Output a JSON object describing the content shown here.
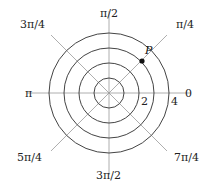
{
  "diagram": {
    "type": "polar-grid",
    "center": {
      "x": 109,
      "y": 93
    },
    "unit_px": 15,
    "circles": [
      1,
      2,
      3,
      4
    ],
    "ray_length_px": 82,
    "colors": {
      "circle": "#444444",
      "ray": "#999999",
      "point": "#111111"
    },
    "angle_labels": [
      {
        "text": "0",
        "x": 185,
        "y": 97
      },
      {
        "text": "π/4",
        "x": 176,
        "y": 28
      },
      {
        "text": "π/2",
        "x": 100,
        "y": 17
      },
      {
        "text": "3π/4",
        "x": 20,
        "y": 28
      },
      {
        "text": "π",
        "x": 25,
        "y": 97
      },
      {
        "text": "5π/4",
        "x": 17,
        "y": 161
      },
      {
        "text": "3π/2",
        "x": 96,
        "y": 179
      },
      {
        "text": "7π/4",
        "x": 174,
        "y": 161
      }
    ],
    "radius_labels": [
      {
        "text": "2",
        "x": 141,
        "y": 105
      },
      {
        "text": "4",
        "x": 171,
        "y": 105
      }
    ],
    "point": {
      "label": "P",
      "r": 3,
      "theta": "π/4",
      "x": 142,
      "y": 61,
      "label_x": 145,
      "label_y": 54
    }
  }
}
